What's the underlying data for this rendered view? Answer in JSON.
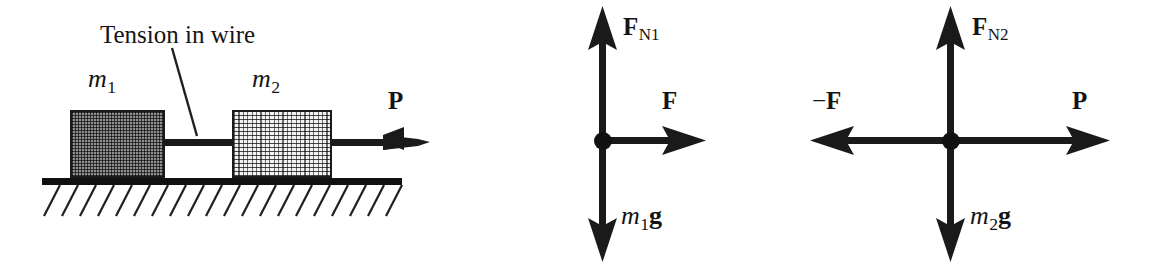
{
  "figure": {
    "background_color": "#ffffff",
    "ink_color": "#141414",
    "width": 1176,
    "height": 272
  },
  "scene": {
    "name": "two-blocks-on-ground",
    "annotation": {
      "text": "Tension in wire",
      "leader_icon": "leader-line-icon"
    },
    "block1": {
      "label_m": "m",
      "label_sub": "1",
      "fill_color": "#8e8e8e",
      "edge_color": "#1a1a1a"
    },
    "block2": {
      "label_m": "m",
      "label_sub": "2",
      "fill_color": "#f2f2f2",
      "edge_color": "#1a1a1a"
    },
    "wire": {
      "name": "connecting-wire"
    },
    "ground": {
      "name": "hatched-ground",
      "color": "#111111"
    },
    "applied_force": {
      "symbol": "P",
      "direction": "right"
    }
  },
  "fbd1": {
    "title_name": "free-body-diagram-block-1",
    "forces": [
      {
        "symbol": "F",
        "subscript": "N1",
        "direction": "up",
        "icon": "arrow-up-icon"
      },
      {
        "symbol": "F",
        "subscript": "",
        "direction": "right",
        "icon": "arrow-right-icon"
      },
      {
        "symbol": "m",
        "subscript": "1",
        "trailing": "g",
        "direction": "down",
        "icon": "arrow-down-icon"
      }
    ],
    "normal_force": {
      "base": "F",
      "sub": "N1"
    },
    "tension_force": {
      "base": "F"
    },
    "weight_force": {
      "mass": "m",
      "sub": "1",
      "gravity": "g"
    }
  },
  "fbd2": {
    "title_name": "free-body-diagram-block-2",
    "forces": [
      {
        "symbol": "F",
        "subscript": "N2",
        "direction": "up",
        "icon": "arrow-up-icon"
      },
      {
        "symbol": "−F",
        "subscript": "",
        "direction": "left",
        "icon": "arrow-left-icon"
      },
      {
        "symbol": "P",
        "subscript": "",
        "direction": "right",
        "icon": "arrow-right-icon"
      },
      {
        "symbol": "m",
        "subscript": "2",
        "trailing": "g",
        "direction": "down",
        "icon": "arrow-down-icon"
      }
    ],
    "normal_force": {
      "base": "F",
      "sub": "N2"
    },
    "reaction_force": {
      "minus": "−",
      "base": "F"
    },
    "applied_force": {
      "base": "P"
    },
    "weight_force": {
      "mass": "m",
      "sub": "2",
      "gravity": "g"
    }
  }
}
